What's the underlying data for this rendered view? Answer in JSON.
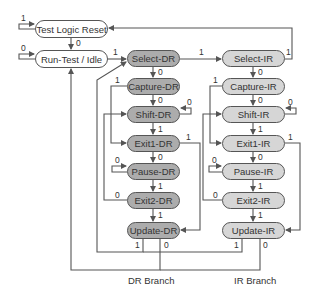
{
  "diagram": {
    "colors": {
      "line": "#555555",
      "dr_fill": "#acacac",
      "ir_fill": "#d6d6d6",
      "idle_fill": "#ffffff"
    },
    "states": {
      "tlr": "Test Logic Reset",
      "rti": "Run-Test / Idle",
      "select_dr": "Select-DR",
      "capture_dr": "Capture-DR",
      "shift_dr": "Shift-DR",
      "exit1_dr": "Exit1-DR",
      "pause_dr": "Pause-DR",
      "exit2_dr": "Exit2-DR",
      "update_dr": "Update-DR",
      "select_ir": "Select-IR",
      "capture_ir": "Capture-IR",
      "shift_ir": "Shift-IR",
      "exit1_ir": "Exit1-IR",
      "pause_ir": "Pause-IR",
      "exit2_ir": "Exit2-IR",
      "update_ir": "Update-IR"
    },
    "branches": {
      "dr": "DR Branch",
      "ir": "IR Branch"
    },
    "edge_labels": {
      "tlr_self": "1",
      "tlr_to_rti": "0",
      "rti_self": "0",
      "rti_to_sdr": "1",
      "sdr_to_sir": "1",
      "sir_to_tlr": "1",
      "sdr_to_cdr": "0",
      "sir_to_cir": "0",
      "cdr_to_e1dr": "1",
      "cdr_to_shdr": "0",
      "shdr_self": "0",
      "shdr_to_e1dr": "1",
      "e1dr_to_udr": "1",
      "e1dr_to_pdr": "0",
      "pdr_self": "0",
      "pdr_to_e2dr": "1",
      "e2dr_to_shdr": "0",
      "e2dr_to_udr": "1",
      "udr_to_sdr": "1",
      "udr_to_rti": "0",
      "cir_to_e1ir": "1",
      "cir_to_shir": "0",
      "shir_self": "0",
      "shir_to_e1ir": "1",
      "e1ir_to_uir": "1",
      "e1ir_to_pir": "0",
      "pir_self": "0",
      "pir_to_e2ir": "1",
      "e2ir_to_shir": "0",
      "e2ir_to_uir": "1",
      "uir_to_sdr": "1",
      "uir_to_rti": "0"
    }
  }
}
